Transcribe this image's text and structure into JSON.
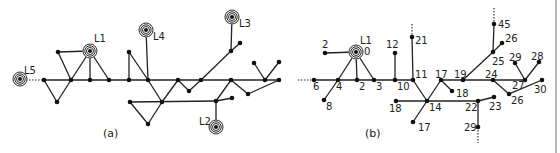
{
  "panels": {
    "a": {
      "caption": "(a)",
      "caption_pos": [
        103,
        137
      ],
      "loads": [
        {
          "id": "L1",
          "label": "L1",
          "x": 90,
          "y": 51,
          "lx": 94,
          "ly": 42
        },
        {
          "id": "L2",
          "label": "L2",
          "x": 216,
          "y": 127,
          "lx": 199,
          "ly": 125
        },
        {
          "id": "L3",
          "label": "L3",
          "x": 232,
          "y": 17,
          "lx": 239,
          "ly": 27
        },
        {
          "id": "L4",
          "label": "L4",
          "x": 146,
          "y": 30,
          "lx": 153,
          "ly": 40
        },
        {
          "id": "L5",
          "label": "L5",
          "x": 20,
          "y": 79,
          "lx": 24,
          "ly": 74
        }
      ],
      "nodes": [
        [
          44,
          80
        ],
        [
          58,
          52
        ],
        [
          71,
          80
        ],
        [
          57,
          102
        ],
        [
          90,
          80
        ],
        [
          109,
          80
        ],
        [
          129,
          52
        ],
        [
          129,
          80
        ],
        [
          148,
          80
        ],
        [
          162,
          102
        ],
        [
          130,
          102
        ],
        [
          148,
          124
        ],
        [
          178,
          80
        ],
        [
          189,
          91
        ],
        [
          201,
          80
        ],
        [
          231,
          80
        ],
        [
          231,
          51
        ],
        [
          240,
          43
        ],
        [
          265,
          80
        ],
        [
          254,
          63
        ],
        [
          279,
          62
        ],
        [
          248,
          94
        ],
        [
          279,
          80
        ],
        [
          216,
          101
        ],
        [
          232,
          98
        ]
      ],
      "edges": [
        [
          44,
          80,
          279,
          80
        ],
        [
          44,
          80,
          57,
          102
        ],
        [
          57,
          102,
          71,
          80
        ],
        [
          58,
          52,
          71,
          80
        ],
        [
          58,
          52,
          90,
          51
        ],
        [
          71,
          80,
          90,
          51
        ],
        [
          90,
          51,
          90,
          80
        ],
        [
          90,
          51,
          109,
          80
        ],
        [
          129,
          52,
          129,
          80
        ],
        [
          129,
          52,
          148,
          80
        ],
        [
          146,
          30,
          148,
          80
        ],
        [
          148,
          80,
          162,
          102
        ],
        [
          162,
          102,
          178,
          80
        ],
        [
          178,
          80,
          189,
          91
        ],
        [
          189,
          91,
          201,
          80
        ],
        [
          130,
          102,
          148,
          124
        ],
        [
          148,
          124,
          162,
          102
        ],
        [
          130,
          102,
          216,
          101
        ],
        [
          201,
          80,
          231,
          51
        ],
        [
          231,
          51,
          232,
          17
        ],
        [
          231,
          51,
          240,
          43
        ],
        [
          231,
          80,
          216,
          101
        ],
        [
          216,
          101,
          232,
          98
        ],
        [
          216,
          101,
          216,
          127
        ],
        [
          231,
          80,
          248,
          94
        ],
        [
          248,
          94,
          279,
          80
        ],
        [
          265,
          80,
          254,
          63
        ],
        [
          265,
          80,
          279,
          62
        ]
      ],
      "dotted": [
        [
          26,
          80,
          44,
          80
        ]
      ]
    },
    "b": {
      "caption": "(b)",
      "caption_pos": [
        365,
        137
      ],
      "loads": [
        {
          "id": "L1",
          "label": "L1",
          "x": 356,
          "y": 52,
          "lx": 360,
          "ly": 44
        }
      ],
      "nodes": [
        {
          "x": 356,
          "y": 52,
          "label": "0",
          "lx": 364,
          "ly": 55
        },
        {
          "x": 325,
          "y": 53,
          "label": "2",
          "lx": 322,
          "ly": 48
        },
        {
          "x": 357,
          "y": 80,
          "label": "2",
          "lx": 359,
          "ly": 90
        },
        {
          "x": 338,
          "y": 80,
          "label": "4",
          "lx": 336,
          "ly": 90
        },
        {
          "x": 314,
          "y": 80,
          "label": "6",
          "lx": 313,
          "ly": 90
        },
        {
          "x": 324,
          "y": 100,
          "label": "8",
          "lx": 326,
          "ly": 110
        },
        {
          "x": 374,
          "y": 80,
          "label": "3",
          "lx": 376,
          "ly": 90
        },
        {
          "x": 395,
          "y": 80,
          "label": "10",
          "lx": 397,
          "ly": 90
        },
        {
          "x": 395,
          "y": 53,
          "label": "12",
          "lx": 386,
          "ly": 48
        },
        {
          "x": 413,
          "y": 80,
          "label": "11",
          "lx": 415,
          "ly": 78
        },
        {
          "x": 412,
          "y": 37,
          "label": "21",
          "lx": 415,
          "ly": 44
        },
        {
          "x": 427,
          "y": 101,
          "label": "14",
          "lx": 429,
          "ly": 111
        },
        {
          "x": 396,
          "y": 101,
          "label": "18",
          "lx": 389,
          "ly": 112
        },
        {
          "x": 413,
          "y": 122,
          "label": "17",
          "lx": 418,
          "ly": 131
        },
        {
          "x": 441,
          "y": 80,
          "label": "17",
          "lx": 435,
          "ly": 78
        },
        {
          "x": 452,
          "y": 91,
          "label": "18",
          "lx": 456,
          "ly": 97
        },
        {
          "x": 463,
          "y": 80,
          "label": "19",
          "lx": 454,
          "ly": 78
        },
        {
          "x": 493,
          "y": 80,
          "label": "24",
          "lx": 485,
          "ly": 78
        },
        {
          "x": 493,
          "y": 52,
          "label": "25",
          "lx": 492,
          "ly": 65
        },
        {
          "x": 494,
          "y": 24,
          "label": "45",
          "lx": 498,
          "ly": 28
        },
        {
          "x": 502,
          "y": 43,
          "label": "26",
          "lx": 505,
          "ly": 42
        },
        {
          "x": 525,
          "y": 80,
          "label": "27",
          "lx": 512,
          "ly": 89
        },
        {
          "x": 515,
          "y": 63,
          "label": "29",
          "lx": 509,
          "ly": 61
        },
        {
          "x": 539,
          "y": 62,
          "label": "28",
          "lx": 531,
          "ly": 60
        },
        {
          "x": 542,
          "y": 80,
          "label": "30",
          "lx": 534,
          "ly": 93
        },
        {
          "x": 509,
          "y": 94,
          "label": "26",
          "lx": 511,
          "ly": 104
        },
        {
          "x": 478,
          "y": 101,
          "label": "22",
          "lx": 465,
          "ly": 111
        },
        {
          "x": 494,
          "y": 97,
          "label": "23",
          "lx": 489,
          "ly": 110
        },
        {
          "x": 478,
          "y": 127,
          "label": "29",
          "lx": 464,
          "ly": 131
        }
      ],
      "edges": [
        [
          314,
          80,
          413,
          80
        ],
        [
          441,
          80,
          525,
          80
        ],
        [
          325,
          53,
          356,
          52
        ],
        [
          356,
          52,
          338,
          80
        ],
        [
          356,
          52,
          357,
          80
        ],
        [
          356,
          52,
          374,
          80
        ],
        [
          338,
          80,
          324,
          100
        ],
        [
          395,
          80,
          395,
          53
        ],
        [
          413,
          80,
          412,
          37
        ],
        [
          413,
          80,
          427,
          101
        ],
        [
          427,
          101,
          441,
          80
        ],
        [
          441,
          80,
          452,
          91
        ],
        [
          396,
          101,
          478,
          101
        ],
        [
          427,
          101,
          413,
          122
        ],
        [
          478,
          101,
          494,
          97
        ],
        [
          478,
          101,
          478,
          127
        ],
        [
          463,
          80,
          493,
          52
        ],
        [
          493,
          52,
          494,
          24
        ],
        [
          493,
          52,
          502,
          43
        ],
        [
          493,
          80,
          509,
          94
        ],
        [
          509,
          94,
          542,
          80
        ],
        [
          525,
          80,
          515,
          63
        ],
        [
          525,
          80,
          539,
          62
        ]
      ],
      "dotted": [
        [
          298,
          80,
          314,
          80
        ],
        [
          412,
          24,
          412,
          37
        ],
        [
          494,
          8,
          494,
          24
        ],
        [
          478,
          127,
          478,
          143
        ]
      ]
    }
  },
  "divider_x": 556
}
